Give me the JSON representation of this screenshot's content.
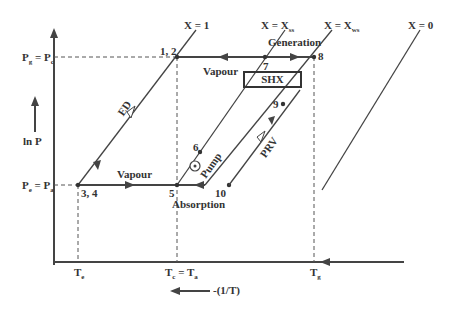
{
  "diagram": {
    "type": "ln P vs -(1/T) absorption refrigeration cycle",
    "y_axis_label": "ln P",
    "x_axis_label": "-(1/T)",
    "pressure_levels": [
      {
        "label": "Pg = Pc",
        "main": "P",
        "sub1": "g",
        "eq": " = P",
        "sub2": "c"
      },
      {
        "label": "Pe = Pa",
        "main": "P",
        "sub1": "e",
        "eq": " = P",
        "sub2": "a"
      }
    ],
    "temperature_levels": [
      {
        "label": "Te",
        "main": "T",
        "sub": "e"
      },
      {
        "label": "Tc = Ta",
        "main": "T",
        "sub1": "c",
        "eq": " = T",
        "sub2": "a"
      },
      {
        "label": "Tg",
        "main": "T",
        "sub": "g"
      }
    ],
    "concentration_lines": [
      {
        "label": "X = 1",
        "text": "X = 1"
      },
      {
        "label": "X = Xss",
        "text": "X = X",
        "sub": "ss"
      },
      {
        "label": "X = Xws",
        "text": "X = X",
        "sub": "ws"
      },
      {
        "label": "X = 0",
        "text": "X = 0"
      }
    ],
    "state_points": [
      "1, 2",
      "3, 4",
      "5",
      "6",
      "7",
      "8",
      "9",
      "10"
    ],
    "process_labels": {
      "generation": "Generation",
      "absorption": "Absorption",
      "vapour_top": "Vapour",
      "vapour_bottom": "Vapour",
      "shx": "SHX",
      "ed": "ED",
      "pump": "Pump",
      "prv": "PRV"
    }
  }
}
